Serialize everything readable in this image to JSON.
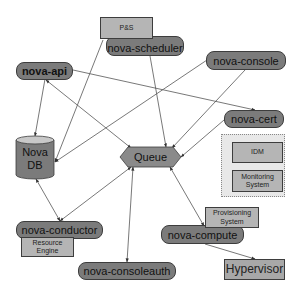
{
  "diagram": {
    "type": "architecture",
    "nodes": {
      "nova_api": {
        "label": "nova-api"
      },
      "nova_scheduler": {
        "label": "nova-scheduler"
      },
      "ps": {
        "label": "P&S"
      },
      "nova_console": {
        "label": "nova-console"
      },
      "nova_cert": {
        "label": "nova-cert"
      },
      "nova_db": {
        "label_line1": "Nova",
        "label_line2": "DB"
      },
      "queue": {
        "label": "Queue"
      },
      "idm": {
        "label": "IDM"
      },
      "monitoring": {
        "label_line1": "Monitoring",
        "label_line2": "System"
      },
      "nova_conductor": {
        "label": "nova-conductor"
      },
      "resource_engine": {
        "label_line1": "Resource",
        "label_line2": "Engine"
      },
      "nova_consoleauth": {
        "label": "nova-consoleauth"
      },
      "provisioning": {
        "label_line1": "Provisioning",
        "label_line2": "System"
      },
      "nova_compute": {
        "label": "nova-compute"
      },
      "hypervisor": {
        "label": "Hypervisor"
      }
    },
    "edges": [
      {
        "from": "nova-api",
        "to": "Nova DB"
      },
      {
        "from": "nova-api",
        "to": "Queue",
        "bidirectional": true
      },
      {
        "from": "nova-api",
        "to": "nova-cert"
      },
      {
        "from": "nova-scheduler",
        "to": "Nova DB"
      },
      {
        "from": "nova-console",
        "to": "Nova DB"
      },
      {
        "from": "nova-scheduler",
        "to": "Queue"
      },
      {
        "from": "nova-console",
        "to": "Queue"
      },
      {
        "from": "nova-cert",
        "to": "Queue"
      },
      {
        "from": "nova-conductor",
        "to": "Nova DB",
        "bidirectional": true
      },
      {
        "from": "nova-conductor",
        "to": "Queue",
        "bidirectional": true
      },
      {
        "from": "nova-consoleauth",
        "to": "Queue",
        "bidirectional": true
      },
      {
        "from": "nova-compute",
        "to": "Queue",
        "bidirectional": true
      },
      {
        "from": "nova-compute",
        "to": "Hypervisor"
      }
    ],
    "colors": {
      "service_fill": "#7b7b7b",
      "box_fill": "#b5b5b5",
      "group_fill": "#e8e8e8",
      "line": "#444444"
    }
  }
}
